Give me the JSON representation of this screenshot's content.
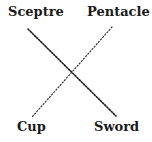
{
  "diagram": {
    "labels": {
      "top_left": "Sceptre",
      "top_right": "Pentacle",
      "bottom_left": "Cup",
      "bottom_right": "Sword"
    },
    "lines": [
      {
        "from": "Sceptre",
        "to": "Sword",
        "style": "dotted"
      },
      {
        "from": "Pentacle",
        "to": "Cup",
        "style": "dotted"
      }
    ],
    "colors": {
      "ink": "#1a1a1a",
      "background": "#ffffff"
    }
  }
}
